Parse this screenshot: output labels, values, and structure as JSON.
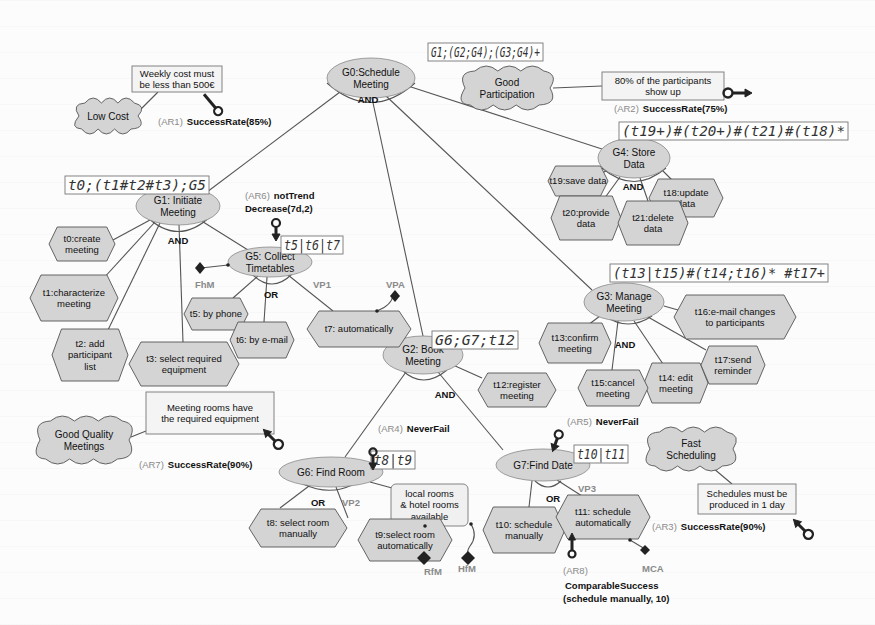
{
  "diagram": {
    "colors": {
      "node_fill": "#d4d4d4",
      "stroke": "#555555",
      "text": "#111111",
      "label_gray": "#8a8a8a",
      "expr_border": "#777777"
    },
    "goals": [
      {
        "id": "G0",
        "label": [
          "G0:Schedule",
          "Meeting"
        ],
        "cx": 371,
        "cy": 78,
        "rx": 44,
        "ry": 20,
        "decomp": "AND"
      },
      {
        "id": "G1",
        "label": [
          "G1: Initiate",
          "Meeting"
        ],
        "cx": 178,
        "cy": 206,
        "rx": 42,
        "ry": 19,
        "decomp": "AND"
      },
      {
        "id": "G5",
        "label": [
          "G5: Collect",
          "Timetables"
        ],
        "cx": 270,
        "cy": 262,
        "rx": 42,
        "ry": 15,
        "decomp": "OR"
      },
      {
        "id": "G4",
        "label": [
          "G4: Store",
          "Data"
        ],
        "cx": 634,
        "cy": 158,
        "rx": 36,
        "ry": 20,
        "decomp": "AND"
      },
      {
        "id": "G3",
        "label": [
          "G3: Manage",
          "Meeting"
        ],
        "cx": 624,
        "cy": 302,
        "rx": 40,
        "ry": 19,
        "decomp": "AND"
      },
      {
        "id": "G2",
        "label": [
          "G2: Book",
          "Meeting"
        ],
        "cx": 423,
        "cy": 355,
        "rx": 40,
        "ry": 19,
        "decomp": "AND"
      },
      {
        "id": "G6",
        "label": [
          "G6: Find Room"
        ],
        "cx": 331,
        "cy": 472,
        "rx": 52,
        "ry": 15,
        "decomp": "OR"
      },
      {
        "id": "G7",
        "label": [
          "G7:Find Date"
        ],
        "cx": 543,
        "cy": 465,
        "rx": 47,
        "ry": 16,
        "decomp": "OR"
      }
    ],
    "tasks": [
      {
        "id": "t0",
        "label": [
          "t0:create",
          "meeting"
        ],
        "cx": 82,
        "cy": 244,
        "w": 66,
        "h": 34
      },
      {
        "id": "t1",
        "label": [
          "t1:characterize",
          "meeting"
        ],
        "cx": 74,
        "cy": 298,
        "w": 88,
        "h": 46
      },
      {
        "id": "t2",
        "label": [
          "t2: add",
          "participant",
          "list"
        ],
        "cx": 90,
        "cy": 355,
        "w": 76,
        "h": 52
      },
      {
        "id": "t3",
        "label": [
          "t3: select required",
          "equipment"
        ],
        "cx": 184,
        "cy": 364,
        "w": 110,
        "h": 44
      },
      {
        "id": "t5",
        "label": [
          "t5: by phone"
        ],
        "cx": 216,
        "cy": 314,
        "w": 64,
        "h": 32
      },
      {
        "id": "t6",
        "label": [
          "t6: by e-mail"
        ],
        "cx": 262,
        "cy": 340,
        "w": 64,
        "h": 36
      },
      {
        "id": "t7",
        "label": [
          "t7: automatically"
        ],
        "cx": 359,
        "cy": 329,
        "w": 104,
        "h": 36
      },
      {
        "id": "t12",
        "label": [
          "t12:register",
          "meeting"
        ],
        "cx": 517,
        "cy": 390,
        "w": 78,
        "h": 34
      },
      {
        "id": "t13",
        "label": [
          "t13:confirm",
          "meeting"
        ],
        "cx": 575,
        "cy": 343,
        "w": 72,
        "h": 40
      },
      {
        "id": "t14",
        "label": [
          "t14: edit",
          "meeting"
        ],
        "cx": 676,
        "cy": 383,
        "w": 64,
        "h": 40
      },
      {
        "id": "t15",
        "label": [
          "t15:cancel",
          "meeting"
        ],
        "cx": 613,
        "cy": 388,
        "w": 70,
        "h": 36
      },
      {
        "id": "t16",
        "label": [
          "t16:e-mail changes",
          "to participants"
        ],
        "cx": 735,
        "cy": 317,
        "w": 122,
        "h": 44
      },
      {
        "id": "t17",
        "label": [
          "t17:send",
          "reminder"
        ],
        "cx": 733,
        "cy": 365,
        "w": 64,
        "h": 38
      },
      {
        "id": "t18",
        "label": [
          "t18:update",
          "data"
        ],
        "cx": 686,
        "cy": 198,
        "w": 74,
        "h": 38
      },
      {
        "id": "t19",
        "label": [
          "t19:save data"
        ],
        "cx": 578,
        "cy": 181,
        "w": 60,
        "h": 30
      },
      {
        "id": "t20",
        "label": [
          "t20:provide",
          "data"
        ],
        "cx": 586,
        "cy": 218,
        "w": 70,
        "h": 44
      },
      {
        "id": "t21",
        "label": [
          "t21:delete",
          "data"
        ],
        "cx": 653,
        "cy": 223,
        "w": 70,
        "h": 44
      },
      {
        "id": "t8",
        "label": [
          "t8: select room",
          "manually"
        ],
        "cx": 298,
        "cy": 528,
        "w": 98,
        "h": 38
      },
      {
        "id": "t9",
        "label": [
          "t9:select room",
          "automatically"
        ],
        "cx": 405,
        "cy": 540,
        "w": 94,
        "h": 42
      },
      {
        "id": "t10",
        "label": [
          "t10: schedule",
          "manually"
        ],
        "cx": 524,
        "cy": 530,
        "w": 82,
        "h": 46
      },
      {
        "id": "t11",
        "label": [
          "t11: schedule",
          "automatically"
        ],
        "cx": 603,
        "cy": 517,
        "w": 94,
        "h": 44
      }
    ],
    "softgoals": [
      {
        "id": "low_cost",
        "label": [
          "Low Cost"
        ],
        "cx": 108,
        "cy": 116,
        "w": 66,
        "h": 32
      },
      {
        "id": "good_participation",
        "label": [
          "Good",
          "Participation"
        ],
        "cx": 507,
        "cy": 88,
        "w": 92,
        "h": 40
      },
      {
        "id": "good_quality",
        "label": [
          "Good Quality",
          "Meetings"
        ],
        "cx": 84,
        "cy": 440,
        "w": 96,
        "h": 44
      },
      {
        "id": "fast_scheduling",
        "label": [
          "Fast",
          "Scheduling"
        ],
        "cx": 691,
        "cy": 449,
        "w": 90,
        "h": 40
      }
    ],
    "constraints": [
      {
        "id": "weekly_cost",
        "label": [
          "Weekly cost must",
          "be less than 500€"
        ],
        "x": 132,
        "y": 66,
        "w": 90,
        "h": 26
      },
      {
        "id": "participants_show",
        "label": [
          "80% of the participants",
          "show up"
        ],
        "x": 602,
        "y": 72,
        "w": 122,
        "h": 28
      },
      {
        "id": "rooms_equipment",
        "label": [
          "Meeting rooms have",
          "the required equipment"
        ],
        "x": 146,
        "y": 392,
        "w": 128,
        "h": 42
      },
      {
        "id": "schedules_1day",
        "label": [
          "Schedules must be",
          "produced in 1 day"
        ],
        "x": 698,
        "y": 484,
        "w": 98,
        "h": 30
      }
    ],
    "resource_note": {
      "label": [
        "local rooms",
        "& hotel rooms",
        "available"
      ],
      "x": 391,
      "y": 484,
      "w": 77,
      "h": 42
    },
    "expressions": [
      {
        "id": "expr_g0",
        "text": "G1;(G2;G4);(G3;G4)+",
        "x": 428,
        "y": 43,
        "w": 115,
        "h": 18
      },
      {
        "id": "expr_g1",
        "text": "t0;(t1#t2#t3);G5",
        "x": 65,
        "y": 176,
        "w": 144,
        "h": 18
      },
      {
        "id": "expr_g5",
        "text": "t5|t6|t7",
        "x": 281,
        "y": 236,
        "w": 62,
        "h": 18
      },
      {
        "id": "expr_g4",
        "text": "(t19+)#(t20+)#(t21)#(t18)*",
        "x": 619,
        "y": 122,
        "w": 229,
        "h": 18
      },
      {
        "id": "expr_g3",
        "text": "(t13|t15)#(t14;t16)* #t17+",
        "x": 610,
        "y": 264,
        "w": 218,
        "h": 18
      },
      {
        "id": "expr_g2",
        "text": "G6;G7;t12",
        "x": 432,
        "y": 331,
        "w": 86,
        "h": 18
      },
      {
        "id": "expr_g6",
        "text": "t8|t9",
        "x": 371,
        "y": 451,
        "w": 44,
        "h": 18
      },
      {
        "id": "expr_g7",
        "text": "t10|t11",
        "x": 574,
        "y": 445,
        "w": 54,
        "h": 18
      }
    ],
    "requirements": [
      {
        "id": "AR1",
        "tag": "(AR1)",
        "rule": "SuccessRate(85%)",
        "x": 158,
        "y": 125
      },
      {
        "id": "AR2",
        "tag": "(AR2)",
        "rule": "SuccessRate(75%)",
        "x": 614,
        "y": 112
      },
      {
        "id": "AR3",
        "tag": "(AR3)",
        "rule": "SuccessRate(90%)",
        "x": 652,
        "y": 530
      },
      {
        "id": "AR4",
        "tag": "(AR4)",
        "rule": "NeverFail",
        "x": 378,
        "y": 432
      },
      {
        "id": "AR5",
        "tag": "(AR5)",
        "rule": "NeverFail",
        "x": 567,
        "y": 425
      },
      {
        "id": "AR6",
        "tag": "(AR6)",
        "rule": "notTrend",
        "rule2": "Decrease(7d,2)",
        "x": 245,
        "y": 199
      },
      {
        "id": "AR7",
        "tag": "(AR7)",
        "rule": "SuccessRate(90%)",
        "x": 139,
        "y": 468
      },
      {
        "id": "AR8",
        "tag": "(AR8)",
        "rule": "ComparableSuccess",
        "rule2": "(schedule manually, 10)",
        "x": 563,
        "y": 574
      }
    ],
    "variation_labels": [
      {
        "text": "VP1",
        "x": 313,
        "y": 288
      },
      {
        "text": "VP2",
        "x": 342,
        "y": 506
      },
      {
        "text": "VP3",
        "x": 578,
        "y": 492
      },
      {
        "text": "VPA",
        "x": 386,
        "y": 288
      },
      {
        "text": "FhM",
        "x": 195,
        "y": 288
      },
      {
        "text": "RfM",
        "x": 424,
        "y": 575
      },
      {
        "text": "HfM",
        "x": 458,
        "y": 572
      },
      {
        "text": "MCA",
        "x": 642,
        "y": 572
      }
    ],
    "decomp_labels": [
      {
        "text": "AND",
        "x": 368,
        "y": 103
      },
      {
        "text": "AND",
        "x": 178,
        "y": 244
      },
      {
        "text": "OR",
        "x": 271,
        "y": 298
      },
      {
        "text": "AND",
        "x": 633,
        "y": 190
      },
      {
        "text": "AND",
        "x": 625,
        "y": 348
      },
      {
        "text": "AND",
        "x": 445,
        "y": 398
      },
      {
        "text": "OR",
        "x": 318,
        "y": 506
      },
      {
        "text": "OR",
        "x": 553,
        "y": 502
      }
    ]
  }
}
